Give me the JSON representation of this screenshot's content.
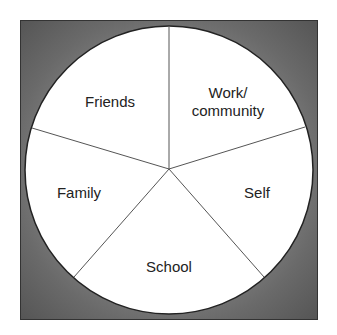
{
  "diagram": {
    "type": "circle-segmented",
    "background": {
      "frame_color_edge": "#555555",
      "frame_color_center": "#9a9a9a",
      "circle_fill": "#ffffff",
      "outline_color": "#222222"
    },
    "segments": [
      {
        "id": "friends",
        "label": "Friends"
      },
      {
        "id": "work-community",
        "label_line1": "Work/",
        "label_line2": "community"
      },
      {
        "id": "self",
        "label": "Self"
      },
      {
        "id": "school",
        "label": "School"
      },
      {
        "id": "family",
        "label": "Family"
      }
    ]
  }
}
